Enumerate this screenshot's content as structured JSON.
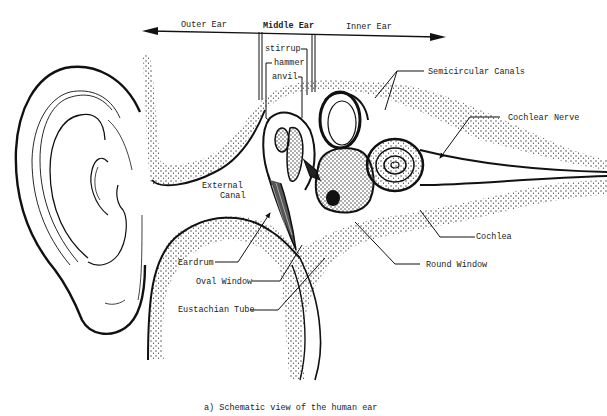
{
  "diagram": {
    "caption": "a) Schematic view of the human ear",
    "regions": {
      "outer": "Outer Ear",
      "middle": "Middle Ear",
      "inner": "Inner Ear"
    },
    "ossicles": {
      "stirrup": "stirrup",
      "hammer": "hammer",
      "anvil": "anvil"
    },
    "labels": {
      "semicircular_canals": "Semicircular Canals",
      "cochlear_nerve": "Cochlear Nerve",
      "external_canal_line1": "External",
      "external_canal_line2": "Canal",
      "cochlea": "Cochlea",
      "round_window": "Round Window",
      "eardrum": "Eardrum",
      "oval_window": "Oval Window",
      "eustachian_tube": "Eustachian Tube"
    },
    "colors": {
      "ink": "#111111",
      "stipple": "#333333",
      "background": "#ffffff"
    }
  }
}
